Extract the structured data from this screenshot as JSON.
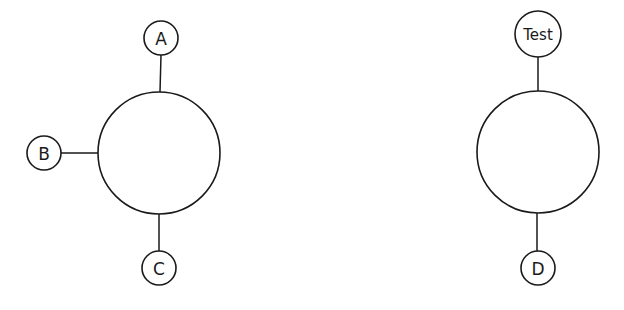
{
  "diagram": {
    "type": "hub-and-spoke",
    "groups": [
      {
        "hub": {
          "cx": 159,
          "cy": 153,
          "r": 61,
          "label": ""
        },
        "spokes": [
          {
            "label": "A",
            "cx": 161,
            "cy": 38,
            "r": 17,
            "side": "top"
          },
          {
            "label": "B",
            "cx": 44,
            "cy": 153,
            "r": 17,
            "side": "left"
          },
          {
            "label": "C",
            "cx": 159,
            "cy": 268,
            "r": 17,
            "side": "bottom"
          }
        ]
      },
      {
        "hub": {
          "cx": 538,
          "cy": 152,
          "r": 61,
          "label": ""
        },
        "spokes": [
          {
            "label": "Test",
            "cx": 538,
            "cy": 34,
            "r": 23,
            "side": "top"
          },
          {
            "label": "D",
            "cx": 538,
            "cy": 268,
            "r": 17,
            "side": "bottom"
          }
        ]
      }
    ]
  },
  "labels": {
    "a": "A",
    "b": "B",
    "c": "C",
    "test": "Test",
    "d": "D"
  },
  "colors": {
    "stroke": "#1a1a1a",
    "background": "#ffffff"
  }
}
